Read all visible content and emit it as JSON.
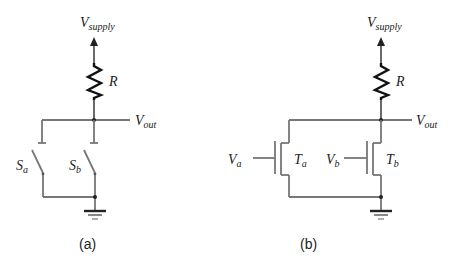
{
  "circuits": [
    {
      "id": "a",
      "caption": "(a)",
      "supply": {
        "main": "V",
        "sub": "supply"
      },
      "resistor": "R",
      "output": {
        "main": "V",
        "sub": "out"
      },
      "switches": [
        {
          "main": "S",
          "sub": "a"
        },
        {
          "main": "S",
          "sub": "b"
        }
      ]
    },
    {
      "id": "b",
      "caption": "(b)",
      "supply": {
        "main": "V",
        "sub": "supply"
      },
      "resistor": "R",
      "output": {
        "main": "V",
        "sub": "out"
      },
      "transistors": [
        {
          "main": "T",
          "sub": "a",
          "gate": {
            "main": "V",
            "sub": "a"
          }
        },
        {
          "main": "T",
          "sub": "b",
          "gate": {
            "main": "V",
            "sub": "b"
          }
        }
      ]
    }
  ]
}
